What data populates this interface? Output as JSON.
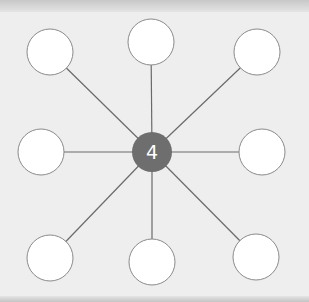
{
  "diagram": {
    "type": "spider-web",
    "center": {
      "label": "4",
      "x": 152,
      "y": 152,
      "r": 20,
      "fill": "#6e6e6e",
      "text_color": "#ffffff"
    },
    "leaf_style": {
      "fill": "#ffffff",
      "stroke": "#8a8a8a",
      "r": 23
    },
    "line_color": "#6a6a6a",
    "leaves": [
      {
        "id": "top-left",
        "x": 50,
        "y": 52,
        "label": ""
      },
      {
        "id": "top",
        "x": 151,
        "y": 42,
        "label": ""
      },
      {
        "id": "top-right",
        "x": 257,
        "y": 52,
        "label": ""
      },
      {
        "id": "left",
        "x": 41,
        "y": 152,
        "label": ""
      },
      {
        "id": "right",
        "x": 262,
        "y": 152,
        "label": ""
      },
      {
        "id": "bottom-left",
        "x": 50,
        "y": 258,
        "label": ""
      },
      {
        "id": "bottom",
        "x": 152,
        "y": 262,
        "label": ""
      },
      {
        "id": "bottom-right",
        "x": 256,
        "y": 257,
        "label": ""
      }
    ]
  }
}
